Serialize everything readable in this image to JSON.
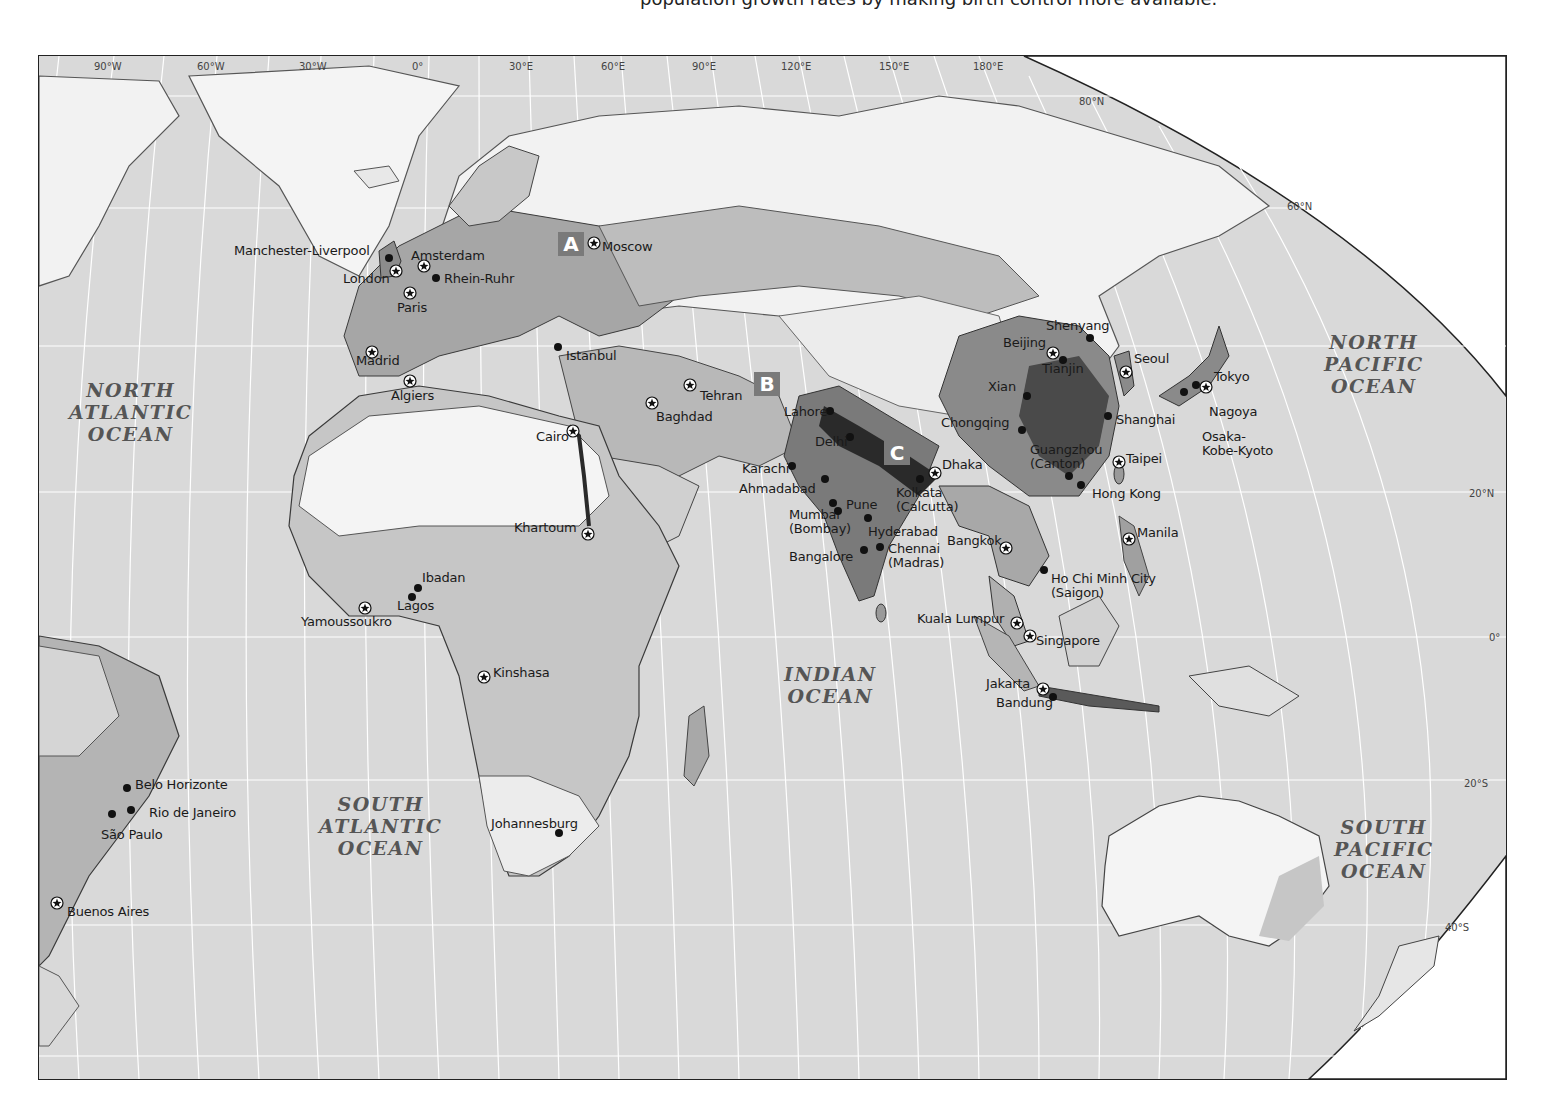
{
  "caption": "population growth rates by making birth control more available.",
  "colors": {
    "ocean": "#d9d9d9",
    "land_sparse": "#f4f4f4",
    "land_low": "#c4c4c4",
    "land_mid": "#a0a0a0",
    "land_high": "#5a5a5a",
    "land_very_high": "#1e1e1e",
    "graticule": "#ffffff",
    "border": "#3a3a3a",
    "region_box": "#7a7a7a"
  },
  "longitude_labels": [
    {
      "text": "90°W",
      "x": 55,
      "y": 5
    },
    {
      "text": "60°W",
      "x": 158,
      "y": 5
    },
    {
      "text": "30°W",
      "x": 260,
      "y": 5
    },
    {
      "text": "0°",
      "x": 373,
      "y": 5
    },
    {
      "text": "30°E",
      "x": 470,
      "y": 5
    },
    {
      "text": "60°E",
      "x": 562,
      "y": 5
    },
    {
      "text": "90°E",
      "x": 653,
      "y": 5
    },
    {
      "text": "120°E",
      "x": 742,
      "y": 5
    },
    {
      "text": "150°E",
      "x": 840,
      "y": 5
    },
    {
      "text": "180°E",
      "x": 934,
      "y": 5
    }
  ],
  "latitude_labels": [
    {
      "text": "80°N",
      "x": 1040,
      "y": 40
    },
    {
      "text": "60°N",
      "x": 1248,
      "y": 145
    },
    {
      "text": "20°N",
      "x": 1430,
      "y": 432
    },
    {
      "text": "0°",
      "x": 1450,
      "y": 576
    },
    {
      "text": "20°S",
      "x": 1425,
      "y": 722
    },
    {
      "text": "40°S",
      "x": 1406,
      "y": 866
    }
  ],
  "oceans": [
    {
      "name": "NORTH\nATLANTIC\nOCEAN",
      "x": 30,
      "y": 323
    },
    {
      "name": "SOUTH\nATLANTIC\nOCEAN",
      "x": 280,
      "y": 737
    },
    {
      "name": "INDIAN\nOCEAN",
      "x": 745,
      "y": 607
    },
    {
      "name": "NORTH\nPACIFIC\nOCEAN",
      "x": 1285,
      "y": 275
    },
    {
      "name": "SOUTH\nPACIFIC\nOCEAN",
      "x": 1295,
      "y": 760
    }
  ],
  "region_markers": [
    {
      "letter": "A",
      "x": 519,
      "y": 176
    },
    {
      "letter": "B",
      "x": 715,
      "y": 316
    },
    {
      "letter": "C",
      "x": 845,
      "y": 385
    }
  ],
  "cities": [
    {
      "name": "Manchester-Liverpool",
      "type": "dot",
      "mx": 350,
      "my": 202,
      "lx": 195,
      "ly": 188
    },
    {
      "name": "London",
      "type": "capital",
      "mx": 357,
      "my": 215,
      "lx": 304,
      "ly": 216
    },
    {
      "name": "Amsterdam",
      "type": "capital",
      "mx": 385,
      "my": 210,
      "lx": 372,
      "ly": 193
    },
    {
      "name": "Rhein-Ruhr",
      "type": "dot",
      "mx": 397,
      "my": 222,
      "lx": 405,
      "ly": 216
    },
    {
      "name": "Paris",
      "type": "capital",
      "mx": 371,
      "my": 237,
      "lx": 358,
      "ly": 245
    },
    {
      "name": "Moscow",
      "type": "capital",
      "mx": 555,
      "my": 187,
      "lx": 563,
      "ly": 184
    },
    {
      "name": "Madrid",
      "type": "capital",
      "mx": 333,
      "my": 296,
      "lx": 317,
      "ly": 298
    },
    {
      "name": "Istanbul",
      "type": "dot",
      "mx": 519,
      "my": 291,
      "lx": 527,
      "ly": 293
    },
    {
      "name": "Algiers",
      "type": "capital",
      "mx": 371,
      "my": 325,
      "lx": 352,
      "ly": 333
    },
    {
      "name": "Tehran",
      "type": "capital",
      "mx": 651,
      "my": 329,
      "lx": 661,
      "ly": 333
    },
    {
      "name": "Baghdad",
      "type": "capital",
      "mx": 613,
      "my": 347,
      "lx": 617,
      "ly": 354
    },
    {
      "name": "Cairo",
      "type": "capital",
      "mx": 534,
      "my": 375,
      "lx": 497,
      "ly": 374
    },
    {
      "name": "Lahore",
      "type": "dot",
      "mx": 791,
      "my": 355,
      "lx": 745,
      "ly": 349
    },
    {
      "name": "Delhi",
      "type": "dot",
      "mx": 811,
      "my": 381,
      "lx": 776,
      "ly": 379
    },
    {
      "name": "Dhaka",
      "type": "capital",
      "mx": 896,
      "my": 417,
      "lx": 903,
      "ly": 402
    },
    {
      "name": "Karachi",
      "type": "dot",
      "mx": 753,
      "my": 410,
      "lx": 703,
      "ly": 406
    },
    {
      "name": "Ahmadabad",
      "type": "dot",
      "mx": 786,
      "my": 423,
      "lx": 700,
      "ly": 426
    },
    {
      "name": "Kolkata\n(Calcutta)",
      "type": "dot",
      "mx": 881,
      "my": 423,
      "lx": 857,
      "ly": 430
    },
    {
      "name": "Mumbai\n(Bombay)",
      "type": "dot",
      "mx": 794,
      "my": 447,
      "lx": 750,
      "ly": 452
    },
    {
      "name": "Pune",
      "type": "dot",
      "mx": 799,
      "my": 455,
      "lx": 807,
      "ly": 442
    },
    {
      "name": "Hyderabad",
      "type": "dot",
      "mx": 829,
      "my": 462,
      "lx": 829,
      "ly": 469
    },
    {
      "name": "Bangalore",
      "type": "dot",
      "mx": 825,
      "my": 494,
      "lx": 750,
      "ly": 494
    },
    {
      "name": "Chennai\n(Madras)",
      "type": "dot",
      "mx": 841,
      "my": 491,
      "lx": 849,
      "ly": 486
    },
    {
      "name": "Khartoum",
      "type": "capital",
      "mx": 549,
      "my": 478,
      "lx": 475,
      "ly": 465
    },
    {
      "name": "Ibadan",
      "type": "dot",
      "mx": 379,
      "my": 532,
      "lx": 383,
      "ly": 515
    },
    {
      "name": "Lagos",
      "type": "dot",
      "mx": 373,
      "my": 541,
      "lx": 358,
      "ly": 543
    },
    {
      "name": "Yamoussoukro",
      "type": "capital",
      "mx": 326,
      "my": 552,
      "lx": 262,
      "ly": 559
    },
    {
      "name": "Kinshasa",
      "type": "capital",
      "mx": 445,
      "my": 621,
      "lx": 454,
      "ly": 610
    },
    {
      "name": "Johannesburg",
      "type": "dot",
      "mx": 520,
      "my": 777,
      "lx": 452,
      "ly": 761
    },
    {
      "name": "Belo Horizonte",
      "type": "dot",
      "mx": 88,
      "my": 732,
      "lx": 96,
      "ly": 722
    },
    {
      "name": "Rio de Janeiro",
      "type": "dot",
      "mx": 92,
      "my": 754,
      "lx": 110,
      "ly": 750
    },
    {
      "name": "São Paulo",
      "type": "dot",
      "mx": 73,
      "my": 758,
      "lx": 62,
      "ly": 772
    },
    {
      "name": "Buenos Aires",
      "type": "capital",
      "mx": 18,
      "my": 847,
      "lx": 28,
      "ly": 849
    },
    {
      "name": "Shenyang",
      "type": "dot",
      "mx": 1051,
      "my": 282,
      "lx": 1007,
      "ly": 263
    },
    {
      "name": "Beijing",
      "type": "capital",
      "mx": 1014,
      "my": 297,
      "lx": 964,
      "ly": 280
    },
    {
      "name": "Tianjin",
      "type": "dot",
      "mx": 1024,
      "my": 304,
      "lx": 1003,
      "ly": 306
    },
    {
      "name": "Seoul",
      "type": "capital",
      "mx": 1087,
      "my": 316,
      "lx": 1095,
      "ly": 296
    },
    {
      "name": "Tokyo",
      "type": "capital",
      "mx": 1167,
      "my": 331,
      "lx": 1175,
      "ly": 314
    },
    {
      "name": "Nagoya",
      "type": "dot",
      "mx": 1157,
      "my": 329,
      "lx": 1170,
      "ly": 349
    },
    {
      "name": "Osaka-\nKobe-Kyoto",
      "type": "dot",
      "mx": 1145,
      "my": 336,
      "lx": 1163,
      "ly": 374
    },
    {
      "name": "Xian",
      "type": "dot",
      "mx": 988,
      "my": 340,
      "lx": 949,
      "ly": 324
    },
    {
      "name": "Shanghai",
      "type": "dot",
      "mx": 1069,
      "my": 360,
      "lx": 1077,
      "ly": 357
    },
    {
      "name": "Chongqing",
      "type": "dot",
      "mx": 983,
      "my": 374,
      "lx": 902,
      "ly": 360
    },
    {
      "name": "Guangzhou\n(Canton)",
      "type": "dot",
      "mx": 1030,
      "my": 420,
      "lx": 991,
      "ly": 387
    },
    {
      "name": "Hong Kong",
      "type": "dot",
      "mx": 1042,
      "my": 429,
      "lx": 1053,
      "ly": 431
    },
    {
      "name": "Taipei",
      "type": "capital",
      "mx": 1080,
      "my": 406,
      "lx": 1087,
      "ly": 396
    },
    {
      "name": "Bangkok",
      "type": "capital",
      "mx": 967,
      "my": 492,
      "lx": 908,
      "ly": 478
    },
    {
      "name": "Manila",
      "type": "capital",
      "mx": 1090,
      "my": 483,
      "lx": 1098,
      "ly": 470
    },
    {
      "name": "Ho Chi Minh City\n(Saigon)",
      "type": "dot",
      "mx": 1005,
      "my": 514,
      "lx": 1012,
      "ly": 516
    },
    {
      "name": "Kuala Lumpur",
      "type": "capital",
      "mx": 978,
      "my": 567,
      "lx": 878,
      "ly": 556
    },
    {
      "name": "Singapore",
      "type": "capital",
      "mx": 991,
      "my": 580,
      "lx": 997,
      "ly": 578
    },
    {
      "name": "Jakarta",
      "type": "capital",
      "mx": 1004,
      "my": 633,
      "lx": 947,
      "ly": 621
    },
    {
      "name": "Bandung",
      "type": "dot",
      "mx": 1014,
      "my": 641,
      "lx": 957,
      "ly": 640
    }
  ]
}
